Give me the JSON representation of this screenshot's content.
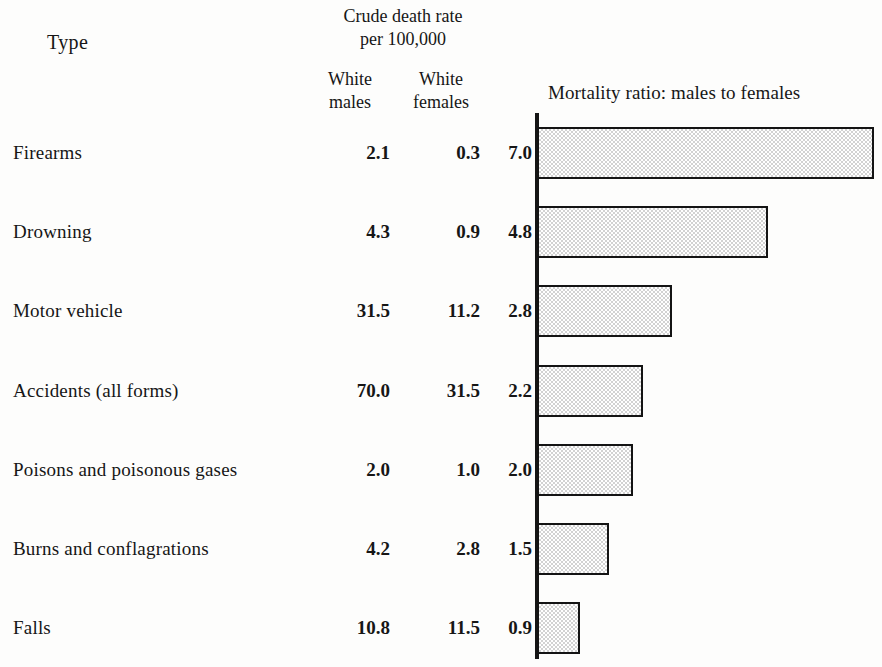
{
  "header": {
    "type_label": "Type",
    "crude_heading_line1": "Crude death rate",
    "crude_heading_line2": "per 100,000",
    "col_males_line1": "White",
    "col_males_line2": "males",
    "col_females_line1": "White",
    "col_females_line2": "females",
    "chart_title": "Mortality ratio: males to females"
  },
  "chart_data": {
    "type": "bar",
    "orientation": "horizontal",
    "title": "Mortality ratio: males to females",
    "xlabel": "",
    "ylabel": "Type",
    "grid": false,
    "legend": false,
    "xlim": [
      0,
      7.0
    ],
    "axis_origin": 0,
    "categories": [
      "Firearms",
      "Drowning",
      "Motor vehicle",
      "Accidents (all forms)",
      "Poisons and poisonous gases",
      "Burns and conflagrations",
      "Falls"
    ],
    "values": [
      7.0,
      4.8,
      2.8,
      2.2,
      2.0,
      1.5,
      0.9
    ],
    "value_labels": [
      "7.0",
      "4.8",
      "2.8",
      "2.2",
      "2.0",
      "1.5",
      "0.9"
    ],
    "series": [
      {
        "name": "Crude death rate per 100,000 — White males",
        "values": [
          2.1,
          4.3,
          31.5,
          70.0,
          2.0,
          4.2,
          10.8
        ],
        "labels": [
          "2.1",
          "4.3",
          "31.5",
          "70.0",
          "2.0",
          "4.2",
          "10.8"
        ]
      },
      {
        "name": "Crude death rate per 100,000 — White females",
        "values": [
          0.3,
          0.9,
          11.2,
          31.5,
          1.0,
          2.8,
          11.5
        ],
        "labels": [
          "0.3",
          "0.9",
          "11.2",
          "31.5",
          "1.0",
          "2.8",
          "11.5"
        ]
      },
      {
        "name": "Mortality ratio: males to females",
        "values": [
          7.0,
          4.8,
          2.8,
          2.2,
          2.0,
          1.5,
          0.9
        ],
        "labels": [
          "7.0",
          "4.8",
          "2.8",
          "2.2",
          "2.0",
          "1.5",
          "0.9"
        ]
      }
    ],
    "bar_fill_color": "#d2d2d2",
    "bar_edge_color": "#141414",
    "background_color": "#fdfdfc"
  },
  "rows": [
    {
      "label": "Firearms",
      "males": "2.1",
      "females": "0.3",
      "ratio": "7.0",
      "ratio_value": 7.0
    },
    {
      "label": "Drowning",
      "males": "4.3",
      "females": "0.9",
      "ratio": "4.8",
      "ratio_value": 4.8
    },
    {
      "label": "Motor vehicle",
      "males": "31.5",
      "females": "11.2",
      "ratio": "2.8",
      "ratio_value": 2.8
    },
    {
      "label": "Accidents (all forms)",
      "males": "70.0",
      "females": "31.5",
      "ratio": "2.2",
      "ratio_value": 2.2
    },
    {
      "label": "Poisons and poisonous gases",
      "males": "2.0",
      "females": "1.0",
      "ratio": "2.0",
      "ratio_value": 2.0
    },
    {
      "label": "Burns and conflagrations",
      "males": "4.2",
      "females": "2.8",
      "ratio": "1.5",
      "ratio_value": 1.5
    },
    {
      "label": "Falls",
      "males": "10.8",
      "females": "11.5",
      "ratio": "0.9",
      "ratio_value": 0.9
    }
  ]
}
